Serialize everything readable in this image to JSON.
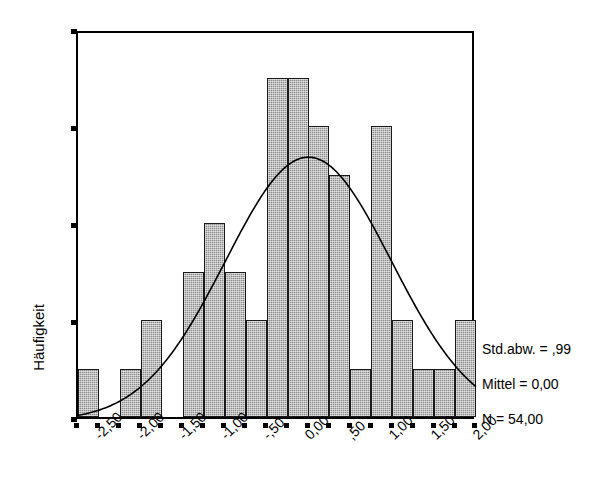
{
  "chart_data": {
    "type": "bar",
    "title": "",
    "subtitle": "",
    "xlabel": "",
    "ylabel": "Häufigkeit",
    "ylim": [
      0,
      8
    ],
    "xlim": [
      -2.75,
      2.0
    ],
    "grid": false,
    "bin_width": 0.25,
    "categories": [
      "-2,75 – -2,50",
      "-2,50 – -2,25",
      "-2,25 – -2,00",
      "-2,00 – -1,75",
      "-1,75 – -1,50",
      "-1,50 – -1,25",
      "-1,25 – -1,00",
      "-1,00 – -,75",
      "-,75 – -,50",
      "-,50 – -,25",
      "-,25 – 0,00",
      "0,00 – ,25",
      ",25 – ,50",
      ",50 – ,75",
      ",75 – 1,00",
      "1,00 – 1,25",
      "1,25 – 1,50",
      "1,50 – 1,75",
      "1,75 – 2,00"
    ],
    "values": [
      1,
      0,
      1,
      2,
      0,
      3,
      4,
      3,
      2,
      7,
      7,
      6,
      5,
      1,
      6,
      2,
      1,
      1,
      2
    ],
    "bar_color": "#8a8a8a",
    "bar_edge_color": "#1a1a1a",
    "curve_color": "#000000",
    "overlay_curve": "normal",
    "y_ticks": [
      "0",
      "2",
      "4",
      "6",
      "8"
    ],
    "y_tick_values": [
      0,
      2,
      4,
      6,
      8
    ],
    "x_ticks": [
      "-2,50",
      "-2,00",
      "-1,50",
      "-1,00",
      "-,50",
      "0,00",
      ",50",
      "1,00",
      "1,50",
      "2,00"
    ],
    "x_tick_values": [
      -2.5,
      -2.0,
      -1.5,
      -1.0,
      -0.5,
      0.0,
      0.5,
      1.0,
      1.5,
      2.0
    ],
    "annotations": [
      "Std.abw. = ,99",
      "Mittel = 0,00",
      "N = 54,00"
    ]
  },
  "axes": {
    "y_title": "Häufigkeit",
    "y_labels": {
      "t0": "0",
      "t1": "2",
      "t2": "4",
      "t3": "6",
      "t4": "8"
    },
    "x_labels": {
      "t0": "-2,50",
      "t1": "-2,00",
      "t2": "-1,50",
      "t3": "-1,00",
      "t4": "-,50",
      "t5": "0,00",
      "t6": ",50",
      "t7": "1,00",
      "t8": "1,50",
      "t9": "2,00"
    }
  },
  "stats": {
    "std_dev": "Std.abw. = ,99",
    "mean": "Mittel = 0,00",
    "n": "N = 54,00"
  }
}
